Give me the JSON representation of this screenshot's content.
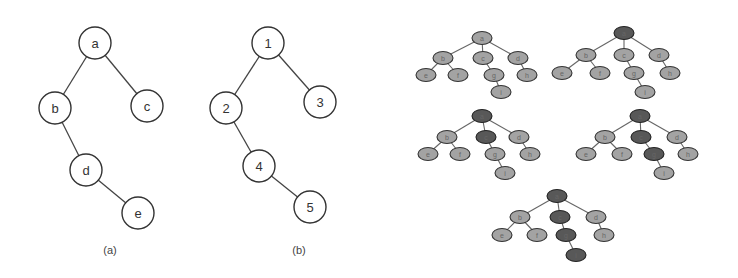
{
  "figure": {
    "panels": [
      {
        "id": "a",
        "caption": "(a)",
        "caption_pos": [
          110,
          250
        ],
        "nodes": [
          {
            "label": "a",
            "x": 95,
            "y": 43
          },
          {
            "label": "b",
            "x": 55,
            "y": 108
          },
          {
            "label": "c",
            "x": 147,
            "y": 106
          },
          {
            "label": "d",
            "x": 86,
            "y": 170
          },
          {
            "label": "e",
            "x": 138,
            "y": 213
          }
        ],
        "edges": [
          [
            "a",
            "b"
          ],
          [
            "a",
            "c"
          ],
          [
            "b",
            "d"
          ],
          [
            "d",
            "e"
          ]
        ]
      },
      {
        "id": "b",
        "caption": "(b)",
        "caption_pos": [
          299,
          250
        ],
        "nodes": [
          {
            "label": "1",
            "x": 268,
            "y": 43
          },
          {
            "label": "2",
            "x": 226,
            "y": 108
          },
          {
            "label": "3",
            "x": 320,
            "y": 102
          },
          {
            "label": "4",
            "x": 259,
            "y": 166
          },
          {
            "label": "5",
            "x": 310,
            "y": 207
          }
        ],
        "edges": [
          [
            "1",
            "2"
          ],
          [
            "1",
            "3"
          ],
          [
            "2",
            "4"
          ],
          [
            "4",
            "5"
          ]
        ]
      }
    ],
    "small_trees": [
      {
        "id": "step-1",
        "nodes": [
          {
            "label": "a",
            "x": 482,
            "y": 38,
            "dark": false
          },
          {
            "label": "b",
            "x": 443,
            "y": 58,
            "dark": false
          },
          {
            "label": "c",
            "x": 483,
            "y": 58,
            "dark": false
          },
          {
            "label": "d",
            "x": 518,
            "y": 58,
            "dark": false
          },
          {
            "label": "e",
            "x": 426,
            "y": 75,
            "dark": false
          },
          {
            "label": "f",
            "x": 458,
            "y": 75,
            "dark": false
          },
          {
            "label": "g",
            "x": 494,
            "y": 75,
            "dark": false
          },
          {
            "label": "h",
            "x": 527,
            "y": 75,
            "dark": false
          },
          {
            "label": "i",
            "x": 501,
            "y": 92,
            "dark": false
          }
        ]
      },
      {
        "id": "step-2",
        "nodes": [
          {
            "label": "a",
            "x": 624,
            "y": 33,
            "dark": true
          },
          {
            "label": "b",
            "x": 586,
            "y": 55,
            "dark": false
          },
          {
            "label": "c",
            "x": 624,
            "y": 55,
            "dark": false
          },
          {
            "label": "d",
            "x": 659,
            "y": 55,
            "dark": false
          },
          {
            "label": "e",
            "x": 562,
            "y": 73,
            "dark": false
          },
          {
            "label": "f",
            "x": 600,
            "y": 73,
            "dark": false
          },
          {
            "label": "g",
            "x": 634,
            "y": 73,
            "dark": false
          },
          {
            "label": "h",
            "x": 670,
            "y": 73,
            "dark": false
          },
          {
            "label": "i",
            "x": 645,
            "y": 92,
            "dark": false
          }
        ]
      },
      {
        "id": "step-3",
        "nodes": [
          {
            "label": "a",
            "x": 482,
            "y": 116,
            "dark": true
          },
          {
            "label": "b",
            "x": 447,
            "y": 137,
            "dark": false
          },
          {
            "label": "c",
            "x": 486,
            "y": 137,
            "dark": true
          },
          {
            "label": "d",
            "x": 519,
            "y": 137,
            "dark": false
          },
          {
            "label": "e",
            "x": 428,
            "y": 154,
            "dark": false
          },
          {
            "label": "f",
            "x": 460,
            "y": 154,
            "dark": false
          },
          {
            "label": "g",
            "x": 495,
            "y": 154,
            "dark": false
          },
          {
            "label": "h",
            "x": 530,
            "y": 154,
            "dark": false
          },
          {
            "label": "i",
            "x": 505,
            "y": 173,
            "dark": false
          }
        ]
      },
      {
        "id": "step-4",
        "nodes": [
          {
            "label": "a",
            "x": 640,
            "y": 116,
            "dark": true
          },
          {
            "label": "b",
            "x": 605,
            "y": 137,
            "dark": false
          },
          {
            "label": "c",
            "x": 641,
            "y": 137,
            "dark": true
          },
          {
            "label": "d",
            "x": 677,
            "y": 137,
            "dark": false
          },
          {
            "label": "e",
            "x": 586,
            "y": 154,
            "dark": false
          },
          {
            "label": "f",
            "x": 622,
            "y": 154,
            "dark": false
          },
          {
            "label": "g",
            "x": 654,
            "y": 154,
            "dark": true
          },
          {
            "label": "h",
            "x": 688,
            "y": 154,
            "dark": false
          },
          {
            "label": "i",
            "x": 664,
            "y": 173,
            "dark": false
          }
        ]
      },
      {
        "id": "step-5",
        "nodes": [
          {
            "label": "a",
            "x": 557,
            "y": 196,
            "dark": true
          },
          {
            "label": "b",
            "x": 520,
            "y": 217,
            "dark": false
          },
          {
            "label": "c",
            "x": 560,
            "y": 217,
            "dark": true
          },
          {
            "label": "d",
            "x": 596,
            "y": 217,
            "dark": false
          },
          {
            "label": "e",
            "x": 502,
            "y": 235,
            "dark": false
          },
          {
            "label": "f",
            "x": 537,
            "y": 235,
            "dark": false
          },
          {
            "label": "g",
            "x": 566,
            "y": 235,
            "dark": true
          },
          {
            "label": "h",
            "x": 604,
            "y": 235,
            "dark": false
          },
          {
            "label": "i",
            "x": 576,
            "y": 255,
            "dark": true
          }
        ]
      }
    ],
    "small_tree_edges": [
      [
        "a",
        "b"
      ],
      [
        "a",
        "c"
      ],
      [
        "a",
        "d"
      ],
      [
        "b",
        "e"
      ],
      [
        "b",
        "f"
      ],
      [
        "c",
        "g"
      ],
      [
        "d",
        "h"
      ],
      [
        "g",
        "i"
      ]
    ],
    "colors": {
      "unvisited": "#a3a3a3",
      "visited": "#585858",
      "outline": "#333333"
    }
  }
}
